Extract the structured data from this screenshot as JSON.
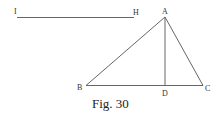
{
  "figure": {
    "caption": "Fig. 30",
    "segment": {
      "start_label": "I",
      "end_label": "H"
    },
    "triangle": {
      "vertices": {
        "A": "A",
        "B": "B",
        "C": "C"
      },
      "altitude_foot": "D"
    },
    "colors": {
      "line": "#666666",
      "text": "#222222",
      "background": "#ffffff"
    }
  }
}
